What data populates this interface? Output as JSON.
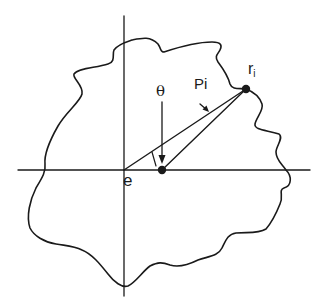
{
  "diagram": {
    "type": "geometric-schematic",
    "labels": {
      "origin": "e",
      "angle": "θ",
      "segment": "Pi",
      "point_main": "r",
      "point_sub": "i"
    },
    "points": {
      "origin_e": [
        124,
        170
      ],
      "center_point": [
        162,
        170
      ],
      "contour_point_ri": [
        246,
        89
      ]
    },
    "colors": {
      "ink": "#1a1a1a",
      "background": "#ffffff"
    }
  }
}
